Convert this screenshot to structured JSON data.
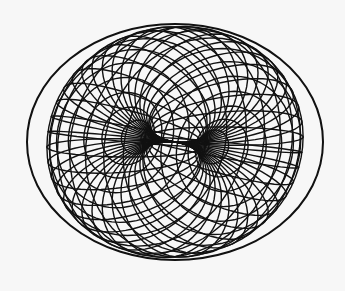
{
  "figure": {
    "title": "",
    "background": "#f7f7f7",
    "stroke": "#111111",
    "outline": {
      "cx": 175,
      "cy": 142,
      "rx": 148,
      "ry": 118
    },
    "throat": {
      "cx": 128,
      "top": 100,
      "bottom": 182
    },
    "upper_funnel": {
      "cx": 128,
      "cy": 100,
      "rx": 42,
      "ry": 20
    },
    "lower_funnel": {
      "cx": 128,
      "cy": 182,
      "rx": 42,
      "ry": 20
    },
    "meridian_count": 20,
    "parallel_count": 12
  }
}
